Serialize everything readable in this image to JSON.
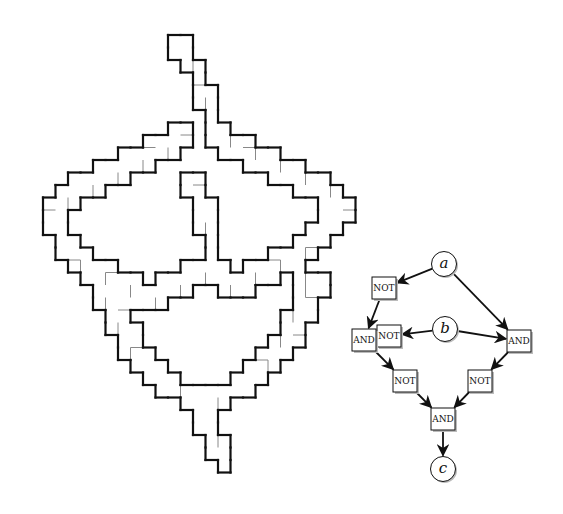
{
  "figure": {
    "left_panel": {
      "description": "polyomino tiling gadget",
      "stroke_color": "#111111",
      "seam_color": "#888888"
    },
    "right_panel": {
      "description": "boolean circuit",
      "inputs": [
        {
          "id": "a",
          "label": "a"
        },
        {
          "id": "b",
          "label": "b"
        }
      ],
      "output": {
        "id": "c",
        "label": "c"
      },
      "gates": [
        {
          "id": "not1",
          "label": "NOT"
        },
        {
          "id": "not2",
          "label": "NOT"
        },
        {
          "id": "and1",
          "label": "AND"
        },
        {
          "id": "and2",
          "label": "AND"
        },
        {
          "id": "not3",
          "label": "NOT"
        },
        {
          "id": "not4",
          "label": "NOT"
        },
        {
          "id": "and3",
          "label": "AND"
        }
      ],
      "edges": [
        [
          "a",
          "not1"
        ],
        [
          "a",
          "and2"
        ],
        [
          "b",
          "not2"
        ],
        [
          "b",
          "and2"
        ],
        [
          "not1",
          "and1"
        ],
        [
          "not2",
          "and1"
        ],
        [
          "and1",
          "not3"
        ],
        [
          "and2",
          "not4"
        ],
        [
          "not3",
          "and3"
        ],
        [
          "not4",
          "and3"
        ],
        [
          "and3",
          "c"
        ]
      ],
      "colors": {
        "stroke": "#111111",
        "box_fill": "#ffffff",
        "shadow": "#bbbbbb"
      }
    }
  }
}
